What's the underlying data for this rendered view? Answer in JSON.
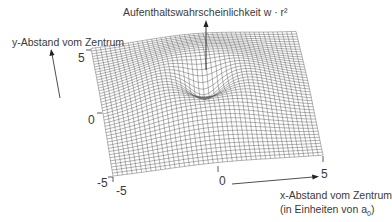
{
  "chart_data": {
    "type": "surface3d",
    "title": "Aufenthaltswahrscheinlichkeit w · r²",
    "zlabel": "Aufenthaltswahrscheinlichkeit w · r²",
    "ylabel": "y-Abstand vom Zentrum",
    "xlabel": "x-Abstand vom Zentrum",
    "xlabel_unit": "(in Einheiten von a₀)",
    "x_ticks": [
      "-5",
      "0",
      "5"
    ],
    "y_ticks": [
      "-5",
      "0",
      "5"
    ],
    "xlim": [
      -5,
      5
    ],
    "ylim": [
      -5,
      5
    ],
    "grid": true,
    "features": {
      "peak_shape": "ring (torus-like rim) centred at origin",
      "center_value": "local minimum (dip)",
      "edges_value": 0
    }
  },
  "labels": {
    "title": "Aufenthaltswahrscheinlichkeit w · r²",
    "y_axis": "y-Abstand vom Zentrum",
    "x_axis": "x-Abstand vom Zentrum",
    "x_axis_unit_prefix": "(in Einheiten von a",
    "x_axis_unit_sub": "0",
    "x_axis_unit_suffix": ")"
  },
  "ticks": {
    "y_top": "5",
    "y_mid": "0",
    "y_bottom": "-5",
    "x_left": "-5",
    "x_mid": "0",
    "x_right": "5"
  },
  "colors": {
    "mesh": "#555555",
    "text": "#3a3a3a",
    "background": "#ffffff"
  }
}
